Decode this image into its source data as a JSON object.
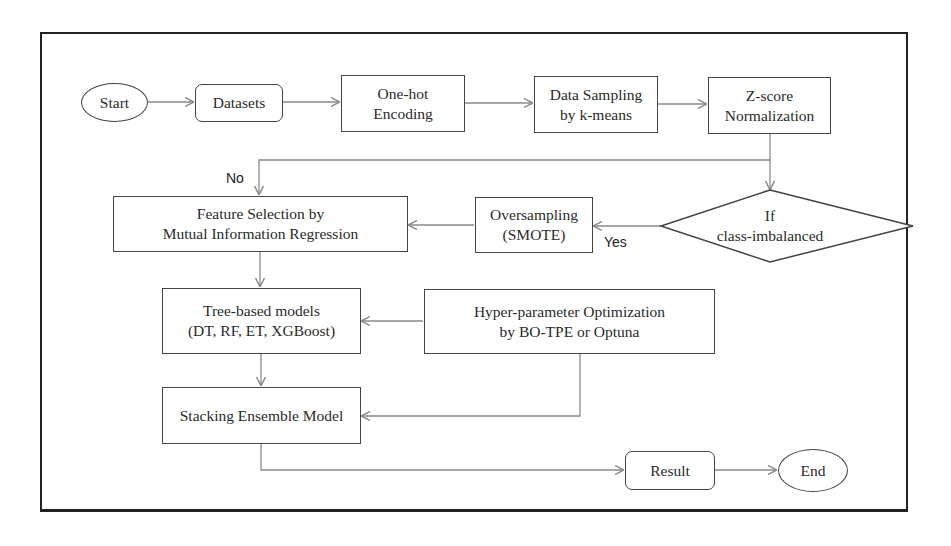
{
  "diagram": {
    "type": "flowchart",
    "nodes": {
      "start": {
        "label": "Start",
        "shape": "ellipse"
      },
      "datasets": {
        "label": "Datasets",
        "shape": "rounded-rect"
      },
      "one_hot": {
        "label": "One-hot\nEncoding",
        "shape": "rect"
      },
      "data_sampling": {
        "label": "Data Sampling\nby k-means",
        "shape": "rect"
      },
      "zscore": {
        "label": "Z-score\nNormalization",
        "shape": "rect"
      },
      "decision": {
        "label": "If\nclass-imbalanced",
        "shape": "diamond"
      },
      "oversampling": {
        "label": "Oversampling\n(SMOTE)",
        "shape": "rect"
      },
      "feature_selection": {
        "label": "Feature Selection by\nMutual Information Regression",
        "shape": "rect"
      },
      "tree_models": {
        "label": "Tree-based models\n(DT, RF, ET, XGBoost)",
        "shape": "rect"
      },
      "hyperparam": {
        "label": "Hyper-parameter Optimization\nby BO-TPE or Optuna",
        "shape": "rect"
      },
      "stacking": {
        "label": "Stacking Ensemble Model",
        "shape": "rect"
      },
      "result": {
        "label": "Result",
        "shape": "rounded-rect"
      },
      "end": {
        "label": "End",
        "shape": "ellipse"
      }
    },
    "edge_labels": {
      "no": "No",
      "yes": "Yes"
    },
    "edges": [
      {
        "from": "start",
        "to": "datasets"
      },
      {
        "from": "datasets",
        "to": "one_hot"
      },
      {
        "from": "one_hot",
        "to": "data_sampling"
      },
      {
        "from": "data_sampling",
        "to": "zscore"
      },
      {
        "from": "zscore",
        "to": "decision"
      },
      {
        "from": "decision",
        "to": "oversampling",
        "label": "Yes"
      },
      {
        "from": "zscore",
        "to": "feature_selection",
        "label": "No"
      },
      {
        "from": "oversampling",
        "to": "feature_selection"
      },
      {
        "from": "feature_selection",
        "to": "tree_models"
      },
      {
        "from": "hyperparam",
        "to": "tree_models"
      },
      {
        "from": "tree_models",
        "to": "stacking"
      },
      {
        "from": "hyperparam",
        "to": "stacking"
      },
      {
        "from": "stacking",
        "to": "result"
      },
      {
        "from": "result",
        "to": "end"
      }
    ],
    "colors": {
      "border": "#444444",
      "edge": "#8a8a8a",
      "frame": "#222222",
      "text": "#2a2a2a"
    }
  }
}
